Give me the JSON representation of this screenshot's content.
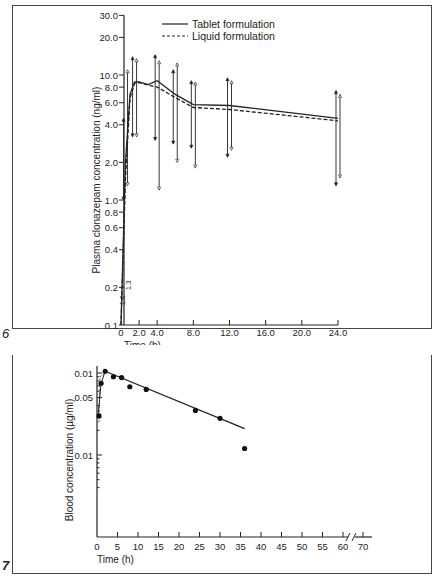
{
  "figures": [
    {
      "label": "6"
    },
    {
      "label": "7"
    }
  ],
  "chart_data": [
    {
      "type": "line",
      "figure_label": "6",
      "title": "",
      "xlabel": "Time (h)",
      "ylabel": "Plasma clonazepam concentration (ng/ml)",
      "yscale": "log",
      "ylim": [
        0.1,
        30.0
      ],
      "xlim": [
        0,
        24.0
      ],
      "x_ticks": [
        "0",
        "2.0",
        "4.0",
        "8.0",
        "12.0",
        "16.0",
        "20.0",
        "24.0"
      ],
      "y_ticks": [
        "0.1",
        "0.2",
        "0.4",
        "0.6",
        "0.8",
        "1.0",
        "2.0",
        "4.0",
        "6.0",
        "8.0",
        "10.0",
        "20.0",
        "30.0"
      ],
      "legend": [
        {
          "name": "Tablet formulation",
          "style": "solid"
        },
        {
          "name": "Liquid formulation",
          "style": "dashed"
        }
      ],
      "legend_position": "top",
      "annotations": [
        "1.0",
        "1.3"
      ],
      "x": [
        0,
        0.5,
        1.0,
        1.5,
        2.0,
        3.0,
        4.0,
        6.0,
        8.0,
        12.0,
        24.0
      ],
      "series": [
        {
          "name": "Tablet formulation",
          "values": [
            0.1,
            2.0,
            7.0,
            8.8,
            8.8,
            8.4,
            9.0,
            7.0,
            5.8,
            5.7,
            4.5
          ]
        },
        {
          "name": "Liquid formulation",
          "values": [
            0.1,
            1.5,
            6.5,
            8.6,
            8.7,
            8.3,
            8.0,
            6.6,
            5.5,
            5.3,
            4.3
          ]
        }
      ],
      "error_bars": [
        {
          "x": 0.5,
          "tablet": [
            1.0,
            4.5
          ],
          "liquid": [
            1.3,
            11.0
          ]
        },
        {
          "x": 1.5,
          "tablet": [
            3.2,
            14.0
          ],
          "liquid": [
            3.2,
            13.5
          ]
        },
        {
          "x": 4.0,
          "tablet": [
            3.0,
            14.5
          ],
          "liquid": [
            1.2,
            13.0
          ]
        },
        {
          "x": 6.0,
          "tablet": [
            2.8,
            11.0
          ],
          "liquid": [
            2.0,
            12.5
          ]
        },
        {
          "x": 8.0,
          "tablet": [
            2.6,
            9.0
          ],
          "liquid": [
            1.8,
            8.8
          ]
        },
        {
          "x": 12.0,
          "tablet": [
            2.2,
            9.5
          ],
          "liquid": [
            2.5,
            9.0
          ]
        },
        {
          "x": 24.0,
          "tablet": [
            1.3,
            7.5
          ],
          "liquid": [
            1.5,
            7.0
          ]
        }
      ],
      "grid": false
    },
    {
      "type": "scatter",
      "figure_label": "7",
      "title": "",
      "xlabel": "Time (h)",
      "ylabel": "Blood concentration (µg/ml)",
      "yscale": "log",
      "y_ticks": [
        "0.01",
        "0.05",
        "0.01"
      ],
      "x_ticks": [
        "0",
        "5",
        "10",
        "15",
        "20",
        "25",
        "30",
        "35",
        "40",
        "45",
        "50",
        "55",
        "60",
        "70"
      ],
      "axis_break": "between 60 and 70",
      "xlim": [
        0,
        70
      ],
      "points": [
        {
          "x": 0.5,
          "y": 0.03
        },
        {
          "x": 1.0,
          "y": 0.075
        },
        {
          "x": 2.0,
          "y": 0.105
        },
        {
          "x": 4.0,
          "y": 0.09
        },
        {
          "x": 6.0,
          "y": 0.088
        },
        {
          "x": 8.0,
          "y": 0.068
        },
        {
          "x": 12.0,
          "y": 0.063
        },
        {
          "x": 24.0,
          "y": 0.035
        },
        {
          "x": 30.0,
          "y": 0.028
        },
        {
          "x": 36.0,
          "y": 0.012
        }
      ],
      "fit_line": {
        "x": [
          2.0,
          36.0
        ],
        "y": [
          0.105,
          0.021
        ]
      },
      "grid": false
    }
  ]
}
